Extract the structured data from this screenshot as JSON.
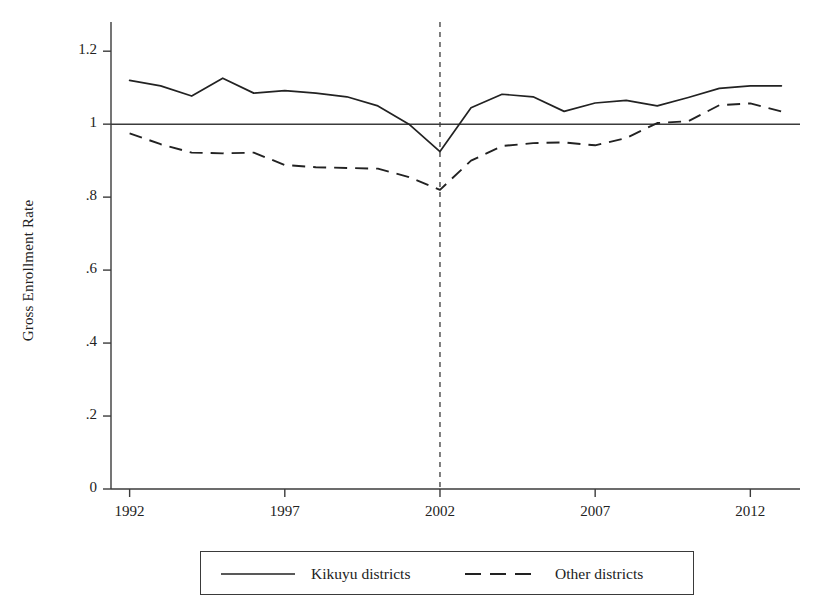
{
  "chart_data": {
    "type": "line",
    "title": "",
    "xlabel": "",
    "ylabel": "Gross Enrollment Rate",
    "xlim": [
      1991.4,
      2013.6
    ],
    "ylim": [
      0,
      1.28
    ],
    "xticks": [
      1992,
      1997,
      2002,
      2007,
      2012
    ],
    "xticklabels": [
      "1992",
      "1997",
      "2002",
      "2007",
      "2012"
    ],
    "yticks": [
      0,
      0.2,
      0.4,
      0.6,
      0.8,
      1,
      1.2
    ],
    "yticklabels": [
      "0",
      ".2",
      ".4",
      ".6",
      ".8",
      "1",
      "1.2"
    ],
    "grid": false,
    "legend_position": "below-axes",
    "reference_lines": [
      {
        "name": "horizontal-reference-line",
        "orientation": "horizontal",
        "value": 1.0,
        "style": "solid"
      },
      {
        "name": "vertical-reference-line",
        "orientation": "vertical",
        "value": 2002,
        "style": "dashed"
      }
    ],
    "x": [
      1992,
      1993,
      1994,
      1995,
      1996,
      1997,
      1998,
      1999,
      2000,
      2001,
      2002,
      2003,
      2004,
      2005,
      2006,
      2007,
      2008,
      2009,
      2010,
      2011,
      2012,
      2013
    ],
    "series": [
      {
        "name": "Kikuyu districts",
        "style": "solid",
        "color": "#222222",
        "values": [
          1.12,
          1.105,
          1.077,
          1.126,
          1.085,
          1.092,
          1.085,
          1.075,
          1.05,
          1.0,
          0.925,
          1.045,
          1.082,
          1.075,
          1.035,
          1.058,
          1.065,
          1.05,
          1.073,
          1.098,
          1.105,
          1.105
        ]
      },
      {
        "name": "Other districts",
        "style": "dashed",
        "color": "#222222",
        "values": [
          0.975,
          0.945,
          0.922,
          0.92,
          0.922,
          0.888,
          0.882,
          0.88,
          0.878,
          0.855,
          0.82,
          0.9,
          0.94,
          0.948,
          0.95,
          0.942,
          0.962,
          1.003,
          1.008,
          1.052,
          1.057,
          1.035
        ]
      }
    ],
    "legend": [
      {
        "label": "Kikuyu districts",
        "style": "solid"
      },
      {
        "label": "Other districts",
        "style": "dashed"
      }
    ]
  }
}
